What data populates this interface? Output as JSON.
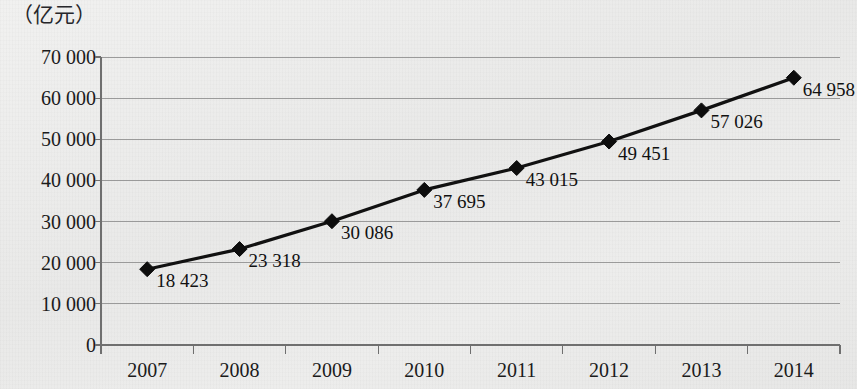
{
  "chart_data": {
    "type": "line",
    "title": "",
    "subtitle": "",
    "ylabel": "（亿元）",
    "xlabel": "",
    "categories": [
      "2007",
      "2008",
      "2009",
      "2010",
      "2011",
      "2012",
      "2013",
      "2014"
    ],
    "values": [
      18423,
      23318,
      30086,
      37695,
      43015,
      49451,
      57026,
      64958
    ],
    "point_labels": [
      "18 423",
      "23 318",
      "30 086",
      "37 695",
      "43 015",
      "49 451",
      "57 026",
      "64 958"
    ],
    "series": [
      {
        "name": "",
        "values": [
          18423,
          23318,
          30086,
          37695,
          43015,
          49451,
          57026,
          64958
        ]
      }
    ],
    "ylim": [
      0,
      70000
    ],
    "yticks": [
      0,
      10000,
      20000,
      30000,
      40000,
      50000,
      60000,
      70000
    ],
    "ytick_labels": [
      "0",
      "10 000",
      "20 000",
      "30 000",
      "40 000",
      "50 000",
      "60 000",
      "70 000"
    ],
    "grid": true,
    "grid_axis": "y",
    "legend": false,
    "legend_position": "none",
    "marker": "diamond",
    "line_color": "#111111",
    "marker_color": "#0d0d0d",
    "grid_color": "#8d8d8d",
    "axis_color": "#6f6f6f",
    "background_color": "#ecebe9",
    "text_color": "#1b1b1b"
  },
  "layout": {
    "plot_left": 101,
    "plot_right": 840,
    "plot_top": 57,
    "plot_bottom": 345
  }
}
